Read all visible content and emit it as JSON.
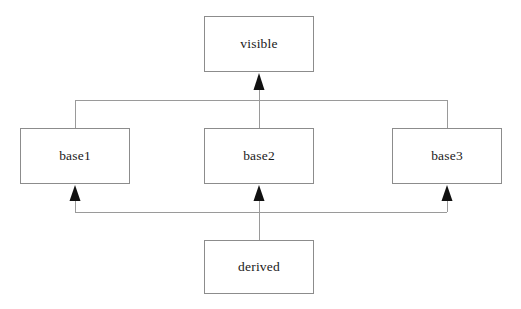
{
  "diagram": {
    "type": "class-inheritance-hierarchy",
    "background_color": "#ffffff",
    "box_border_color": "#8c8c8c",
    "connector_color": "#9a9a9a",
    "arrowhead_color": "#111111",
    "text_color": "#1a1a1a",
    "nodes": [
      {
        "id": "visible",
        "label": "visible",
        "x": 204,
        "y": 16,
        "width": 110,
        "height": 56
      },
      {
        "id": "base1",
        "label": "base1",
        "x": 20,
        "y": 128,
        "width": 110,
        "height": 56
      },
      {
        "id": "base2",
        "label": "base2",
        "x": 204,
        "y": 128,
        "width": 110,
        "height": 56
      },
      {
        "id": "base3",
        "label": "base3",
        "x": 392,
        "y": 128,
        "width": 110,
        "height": 56
      },
      {
        "id": "derived",
        "label": "derived",
        "x": 204,
        "y": 240,
        "width": 110,
        "height": 54
      }
    ],
    "edges": [
      {
        "from": "base1",
        "to": "visible",
        "arrow": "hollow-up-triangle"
      },
      {
        "from": "base2",
        "to": "visible",
        "arrow": "hollow-up-triangle"
      },
      {
        "from": "base3",
        "to": "visible",
        "arrow": "hollow-up-triangle"
      },
      {
        "from": "derived",
        "to": "base1",
        "arrow": "hollow-up-triangle"
      },
      {
        "from": "derived",
        "to": "base2",
        "arrow": "hollow-up-triangle"
      },
      {
        "from": "derived",
        "to": "base3",
        "arrow": "hollow-up-triangle"
      }
    ],
    "bus_lines": [
      {
        "id": "upper-bus",
        "y": 100,
        "x_start": 75,
        "x_end": 447
      },
      {
        "id": "lower-bus",
        "y": 212,
        "x_start": 75,
        "x_end": 447
      }
    ]
  }
}
